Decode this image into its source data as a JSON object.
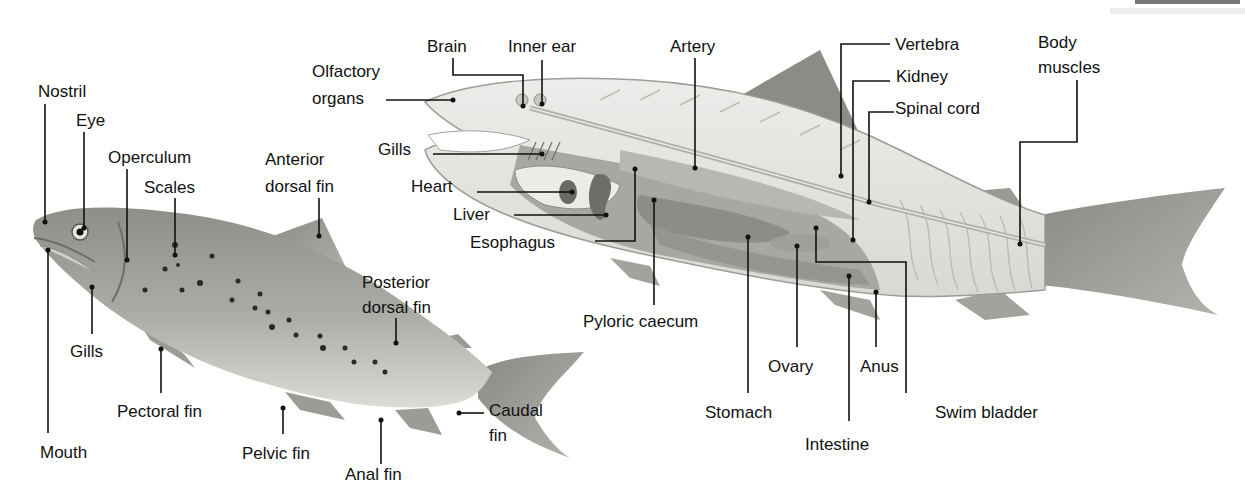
{
  "diagram": {
    "type": "labeled anatomical illustration",
    "colors": {
      "background": "#ffffff",
      "label_text": "#111111",
      "leader_lines": "#111111",
      "fish_skin": "#a9a9a3",
      "fish_belly": "#d6d6d0",
      "organ_dark": "#7a7a74",
      "organ_mid": "#9a9a94",
      "muscle_light": "#e4e4e0"
    }
  },
  "top_cut_text": "",
  "external": {
    "title": "External anatomy (left fish)",
    "labels": {
      "nostril": "Nostril",
      "eye": "Eye",
      "operculum": "Operculum",
      "scales": "Scales",
      "anterior_dorsal_fin_1": "Anterior",
      "anterior_dorsal_fin_2": "dorsal fin",
      "posterior_dorsal_fin_1": "Posterior",
      "posterior_dorsal_fin_2": "dorsal fin",
      "gills": "Gills",
      "pectoral_fin": "Pectoral fin",
      "mouth": "Mouth",
      "pelvic_fin": "Pelvic fin",
      "anal_fin": "Anal fin",
      "caudal_fin_1": "Caudal",
      "caudal_fin_2": "fin"
    }
  },
  "internal": {
    "title": "Internal anatomy (right fish)",
    "labels": {
      "olfactory_1": "Olfactory",
      "olfactory_2": "organs",
      "brain": "Brain",
      "inner_ear": "Inner ear",
      "artery": "Artery",
      "vertebra": "Vertebra",
      "kidney": "Kidney",
      "spinal_cord": "Spinal cord",
      "body_muscles_1": "Body",
      "body_muscles_2": "muscles",
      "gills": "Gills",
      "heart": "Heart",
      "liver": "Liver",
      "esophagus": "Esophagus",
      "pyloric_caecum": "Pyloric caecum",
      "stomach": "Stomach",
      "ovary": "Ovary",
      "anus": "Anus",
      "intestine": "Intestine",
      "swim_bladder": "Swim bladder"
    }
  }
}
